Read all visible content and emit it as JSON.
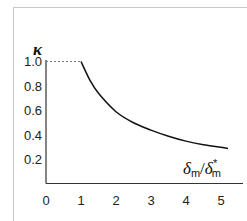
{
  "chart_data": {
    "type": "line",
    "title": "",
    "ylabel": "κ",
    "xlabel": "δm/δm*",
    "xlim": [
      0,
      5.3
    ],
    "ylim": [
      0,
      1.15
    ],
    "x_ticks": [
      "0",
      "1",
      "2",
      "3",
      "4",
      "5"
    ],
    "y_ticks": [
      "0.2",
      "0.4",
      "0.6",
      "0.8",
      "1.0"
    ],
    "grid": false,
    "legend": null,
    "annotations": [
      {
        "type": "dashed-line",
        "from": [
          0,
          1.0
        ],
        "to": [
          1,
          1.0
        ],
        "description": "reference line at κ = 1.0"
      }
    ],
    "series": [
      {
        "name": "κ",
        "x": [
          1.0,
          1.25,
          1.5,
          2.0,
          2.5,
          3.0,
          3.5,
          4.0,
          4.5,
          5.0,
          5.2
        ],
        "values": [
          1.0,
          0.85,
          0.74,
          0.59,
          0.5,
          0.44,
          0.39,
          0.35,
          0.32,
          0.3,
          0.29
        ]
      }
    ]
  },
  "labels": {
    "y_axis": "κ",
    "x_axis_main": "δ",
    "x_axis_sub": "m",
    "x_axis_slash": "/",
    "x_axis_den": "δ",
    "x_axis_den_sub": "m",
    "x_axis_den_sup": "*"
  }
}
